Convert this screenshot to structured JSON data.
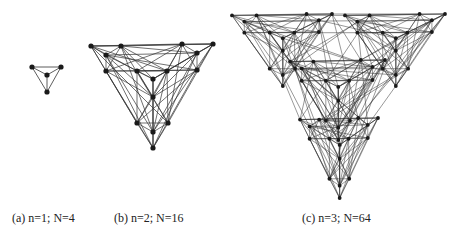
{
  "colors": {
    "ink": "#1a1a1a",
    "edge": "#333333",
    "background": "#ffffff"
  },
  "captions": {
    "a": "(a) n=1; N=4",
    "b": "(b) n=2; N=16",
    "c": "(c) n=3; N=64"
  },
  "graphs": {
    "n1": {
      "nodes": [
        [
          32,
          67
        ],
        [
          61,
          67
        ],
        [
          47,
          75
        ],
        [
          47,
          92
        ]
      ],
      "edges": [
        [
          0,
          1
        ],
        [
          0,
          2
        ],
        [
          1,
          2
        ],
        [
          0,
          3
        ],
        [
          1,
          3
        ],
        [
          2,
          3
        ]
      ]
    },
    "n2": {
      "nodes": [
        [
          91,
          46
        ],
        [
          121,
          46
        ],
        [
          106,
          55
        ],
        [
          106,
          71
        ],
        [
          182,
          44
        ],
        [
          213,
          44
        ],
        [
          197,
          53
        ],
        [
          197,
          70
        ],
        [
          137,
          71
        ],
        [
          167,
          71
        ],
        [
          153,
          79
        ],
        [
          153,
          97
        ],
        [
          137,
          123
        ],
        [
          168,
          123
        ],
        [
          153,
          132
        ],
        [
          153,
          148
        ]
      ]
    },
    "n3": {
      "template_origin": [
        91,
        44
      ],
      "template_size": [
        122,
        104
      ],
      "anchors": [
        {
          "x": 232,
          "y": 14,
          "w": 100,
          "h": 72
        },
        {
          "x": 345,
          "y": 14,
          "w": 100,
          "h": 72
        },
        {
          "x": 290,
          "y": 60,
          "w": 95,
          "h": 80
        },
        {
          "x": 300,
          "y": 118,
          "w": 78,
          "h": 80
        }
      ]
    }
  }
}
